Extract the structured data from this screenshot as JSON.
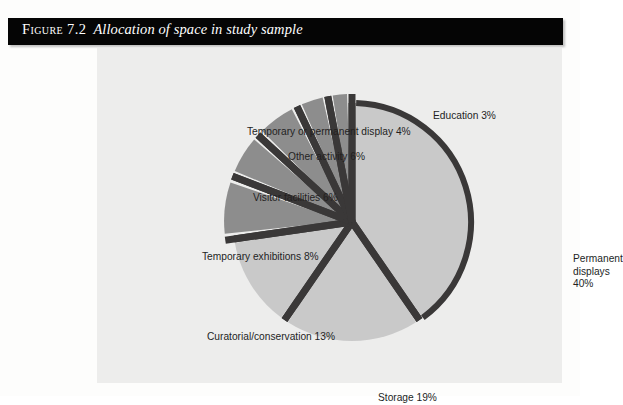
{
  "figure": {
    "number": "Figure 7.2",
    "caption": "Allocation of space in study sample"
  },
  "colors": {
    "title_bar": "#050505",
    "title_text": "#ffffff",
    "panel_background": "#ededec",
    "page_background": "#fdfdfc",
    "slice_light": "#c9c9c9",
    "slice_medium": "#8d8d8d",
    "divider_dark": "#3a3838",
    "label_text": "#231f1f"
  },
  "chart_data": {
    "type": "pie",
    "title": "Allocation of space in study sample",
    "unit": "%",
    "legend_position": "none",
    "labels_outside": true,
    "start_angle_deg": -90,
    "direction": "clockwise",
    "categories": [
      "Permanent displays",
      "Storage",
      "Curatorial/conservation",
      "Temporary exhibitions",
      "Visitor facilities",
      "Other activity",
      "Temporary or permanent display",
      "Education"
    ],
    "values": [
      40,
      19,
      13,
      8,
      6,
      6,
      4,
      3
    ],
    "slices": [
      {
        "name": "Permanent displays",
        "value": 40,
        "label": "Permanent\ndisplays 40%",
        "fill": "#c9c9c9",
        "exploded": false
      },
      {
        "name": "Storage",
        "value": 19,
        "label": "Storage 19%",
        "fill": "#c9c9c9",
        "exploded": false
      },
      {
        "name": "Curatorial/conservation",
        "value": 13,
        "label": "Curatorial/conservation 13%",
        "fill": "#c9c9c9",
        "exploded": false
      },
      {
        "name": "Temporary exhibitions",
        "value": 8,
        "label": "Temporary exhibitions 8%",
        "fill": "#8d8d8d",
        "exploded": true
      },
      {
        "name": "Visitor facilities",
        "value": 6,
        "label": "Visitor facilities 6%",
        "fill": "#8d8d8d",
        "exploded": true
      },
      {
        "name": "Other activity",
        "value": 6,
        "label": "Other activity 6%",
        "fill": "#8d8d8d",
        "exploded": true
      },
      {
        "name": "Temporary or permanent display",
        "value": 4,
        "label": "Temporary or permanent display 4%",
        "fill": "#8d8d8d",
        "exploded": true
      },
      {
        "name": "Education",
        "value": 3,
        "label": "Education 3%",
        "fill": "#8d8d8d",
        "exploded": true
      }
    ]
  }
}
